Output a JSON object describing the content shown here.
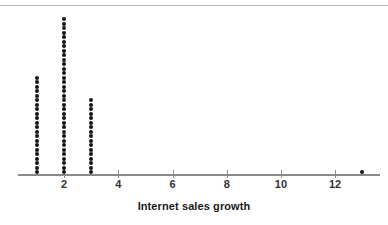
{
  "chart_data": {
    "type": "dotplot",
    "title": "",
    "xlabel": "Internet sales growth",
    "ylabel": "",
    "xlim": [
      0,
      13.8
    ],
    "xtick_values": [
      2,
      4,
      6,
      8,
      10,
      12
    ],
    "xtick_labels": [
      "2",
      "4",
      "6",
      "8",
      "10",
      "12"
    ],
    "grid": false,
    "legend": null,
    "dot_color": "#151515",
    "axis_color": "#8a8a8a",
    "categories": [
      1,
      2,
      3,
      13
    ],
    "values": [
      22,
      35,
      17,
      1
    ],
    "points": [
      {
        "x": 1,
        "count": 22
      },
      {
        "x": 2,
        "count": 35
      },
      {
        "x": 3,
        "count": 17
      },
      {
        "x": 13,
        "count": 1
      }
    ],
    "total_observations": 75,
    "annotations": []
  },
  "axis": {
    "label": "Internet sales growth"
  }
}
